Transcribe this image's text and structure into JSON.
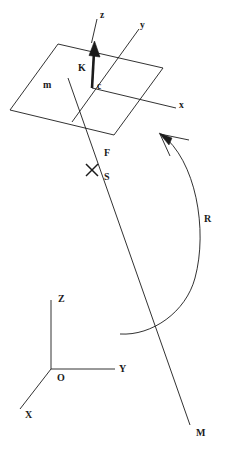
{
  "figure": {
    "type": "technical-line-diagram",
    "title": "",
    "background_color": "#ffffff",
    "stroke_color": "#1b1b1b",
    "width": 226,
    "height": 458
  },
  "labels": {
    "body_frame": {
      "z_axis": "z",
      "y_axis": "y",
      "x_axis": "x",
      "origin": "c",
      "force_vector": "K",
      "plane": "m"
    },
    "line_of_action": {
      "foot_point": "F",
      "point_s": "S",
      "moment_line": "M"
    },
    "rotation": {
      "arc": "R"
    },
    "global_frame": {
      "z_axis": "Z",
      "y_axis": "Y",
      "x_axis": "X",
      "origin": "O"
    }
  },
  "label_positions": {
    "z_body": {
      "x": 100,
      "y": 11
    },
    "y_body": {
      "x": 140,
      "y": 21
    },
    "x_body": {
      "x": 179,
      "y": 101
    },
    "c_body": {
      "x": 97,
      "y": 82
    },
    "K_vector": {
      "x": 78,
      "y": 63
    },
    "m_plane": {
      "x": 43,
      "y": 80
    },
    "F_point": {
      "x": 104,
      "y": 148
    },
    "S_point": {
      "x": 104,
      "y": 172
    },
    "R_arc": {
      "x": 204,
      "y": 214
    },
    "Z_global": {
      "x": 58,
      "y": 294
    },
    "Y_global": {
      "x": 119,
      "y": 364
    },
    "X_global": {
      "x": 25,
      "y": 410
    },
    "O_global": {
      "x": 57,
      "y": 373
    },
    "M_line": {
      "x": 196,
      "y": 428
    }
  },
  "geometry": {
    "plane_quad": "58,44 163,68 114,135 10,110",
    "body_z_axis_thin": "97,19 91,43",
    "body_K_arrow_shaft": "92,88 94,48",
    "body_y_axis": "139,29 72,122",
    "body_x_axis": "92,88 176,108",
    "m_line": "68,78 190,425",
    "x_mark_center": "92,170",
    "rotation_arc": "M 161,134 C 196,160 208,230 195,278 C 186,312 152,336 120,334",
    "global_z_axis": "51,369 51,300",
    "global_y_axis": "51,369 115,369",
    "global_x_axis": "51,369 20,409"
  }
}
